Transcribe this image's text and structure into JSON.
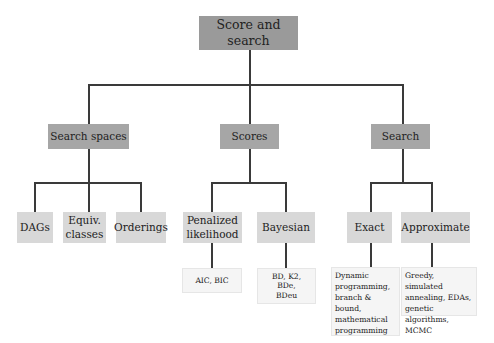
{
  "root": {
    "label": "Score and search"
  },
  "categories": [
    {
      "label": "Search spaces",
      "children": [
        {
          "label": "DAGs"
        },
        {
          "label": "Equiv. classes"
        },
        {
          "label": "Orderings"
        }
      ]
    },
    {
      "label": "Scores",
      "children": [
        {
          "label": "Penalized likelihood",
          "leaf": "AIC, BIC"
        },
        {
          "label": "Bayesian",
          "leaf": "BD, K2, BDe, BDeu"
        }
      ]
    },
    {
      "label": "Search",
      "children": [
        {
          "label": "Exact",
          "leaf": "Dynamic programming, branch & bound, mathematical programming"
        },
        {
          "label": "Approximate",
          "leaf": "Greedy, simulated annealing, EDAs, genetic algorithms, MCMC"
        }
      ]
    }
  ],
  "colors": {
    "root": "#9a9a9a",
    "level1": "#a6a6a6",
    "level2": "#d8d8d8",
    "leaf": "#f5f5f5",
    "connector": "#3a3a3a"
  }
}
